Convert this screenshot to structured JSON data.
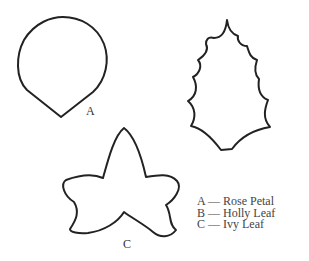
{
  "figure": {
    "shapes": [
      {
        "id": "A",
        "name": "Rose Petal",
        "label": "A"
      },
      {
        "id": "B",
        "name": "Holly Leaf",
        "label": "B"
      },
      {
        "id": "C",
        "name": "Ivy Leaf",
        "label": "C"
      }
    ],
    "labels": {
      "a": "A",
      "c": "C"
    },
    "legend": [
      {
        "key": "A",
        "text": "A — Rose Petal"
      },
      {
        "key": "B",
        "text": "B — Holly Leaf"
      },
      {
        "key": "C",
        "text": "C — Ivy Leaf"
      }
    ],
    "colors": {
      "stroke": "#222222",
      "background": "#ffffff",
      "text": "#444444"
    }
  }
}
